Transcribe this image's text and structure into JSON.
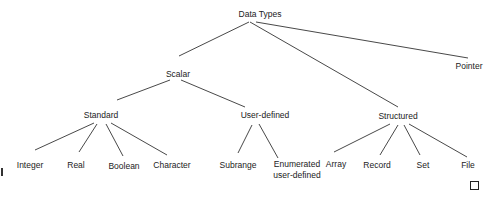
{
  "diagram": {
    "type": "tree",
    "title": "Data Types",
    "nodes": {
      "root": {
        "label": "Data Types",
        "x": 260,
        "y": 9
      },
      "scalar": {
        "label": "Scalar",
        "x": 178,
        "y": 69
      },
      "pointer": {
        "label": "Pointer",
        "x": 469,
        "y": 61
      },
      "standard": {
        "label": "Standard",
        "x": 101,
        "y": 110
      },
      "user_defined": {
        "label": "User-defined",
        "x": 265,
        "y": 110
      },
      "structured": {
        "label": "Structured",
        "x": 398,
        "y": 111
      },
      "integer": {
        "label": "Integer",
        "x": 30,
        "y": 160
      },
      "real": {
        "label": "Real",
        "x": 76,
        "y": 160
      },
      "boolean": {
        "label": "Boolean",
        "x": 124,
        "y": 161
      },
      "character": {
        "label": "Character",
        "x": 172,
        "y": 160
      },
      "subrange": {
        "label": "Subrange",
        "x": 238,
        "y": 160
      },
      "enumerated": {
        "label_line1": "Enumerated",
        "label_line2": "user-defined",
        "x": 297,
        "y": 159
      },
      "array": {
        "label": "Array",
        "x": 336,
        "y": 159
      },
      "record": {
        "label": "Record",
        "x": 377,
        "y": 160
      },
      "set": {
        "label": "Set",
        "x": 423,
        "y": 160
      },
      "file": {
        "label": "File",
        "x": 468,
        "y": 160
      }
    },
    "edges": [
      [
        "Data Types",
        "Scalar"
      ],
      [
        "Data Types",
        "Pointer"
      ],
      [
        "Data Types",
        "Structured"
      ],
      [
        "Scalar",
        "Standard"
      ],
      [
        "Scalar",
        "User-defined"
      ],
      [
        "Standard",
        "Integer"
      ],
      [
        "Standard",
        "Real"
      ],
      [
        "Standard",
        "Boolean"
      ],
      [
        "Standard",
        "Character"
      ],
      [
        "User-defined",
        "Subrange"
      ],
      [
        "User-defined",
        "Enumerated user-defined"
      ],
      [
        "Structured",
        "Array"
      ],
      [
        "Structured",
        "Record"
      ],
      [
        "Structured",
        "Set"
      ],
      [
        "Structured",
        "File"
      ]
    ],
    "colors": {
      "line": "#333333",
      "text": "#222222",
      "background": "#ffffff"
    }
  }
}
